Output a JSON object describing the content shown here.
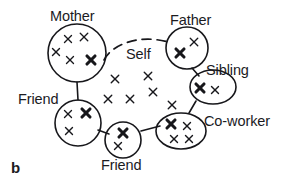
{
  "figure": {
    "panel_label": "b",
    "colors": {
      "ink": "#17171b",
      "background": "#ffffff",
      "text": "#1b1b1f"
    }
  },
  "labels": [
    {
      "id": "mother",
      "text": "Mother",
      "x": 50,
      "y": 9,
      "name": "label-mother"
    },
    {
      "id": "father",
      "text": "Father",
      "x": 170,
      "y": 13,
      "name": "label-father"
    },
    {
      "id": "self",
      "text": "Self",
      "x": 126,
      "y": 47,
      "name": "label-self"
    },
    {
      "id": "sibling",
      "text": "Sibling",
      "x": 206,
      "y": 63,
      "name": "label-sibling"
    },
    {
      "id": "friend_left",
      "text": "Friend",
      "x": 18,
      "y": 92,
      "name": "label-friend-left"
    },
    {
      "id": "coworker",
      "text": "Co-worker",
      "x": 204,
      "y": 114,
      "name": "label-coworker"
    },
    {
      "id": "friend_bottom",
      "text": "Friend",
      "x": 101,
      "y": 158,
      "name": "label-friend-bottom"
    }
  ],
  "clusters": [
    {
      "id": "mother",
      "label": "Mother",
      "shape": "circle",
      "cx": 77,
      "cy": 53,
      "rx": 29,
      "ry": 29,
      "members": [
        {
          "cx": 68,
          "cy": 39,
          "size": 7,
          "weight": "thin"
        },
        {
          "cx": 84,
          "cy": 37,
          "size": 7.5,
          "weight": "thin"
        },
        {
          "cx": 56,
          "cy": 52,
          "size": 7,
          "weight": "thin"
        },
        {
          "cx": 70,
          "cy": 60,
          "size": 7,
          "weight": "thin"
        },
        {
          "cx": 91,
          "cy": 60,
          "size": 8,
          "weight": "bold"
        }
      ]
    },
    {
      "id": "father",
      "label": "Father",
      "shape": "circle",
      "cx": 187,
      "cy": 48,
      "rx": 21,
      "ry": 21,
      "members": [
        {
          "cx": 180,
          "cy": 53,
          "size": 8,
          "weight": "bold"
        },
        {
          "cx": 194,
          "cy": 42,
          "size": 7.5,
          "weight": "thin"
        }
      ]
    },
    {
      "id": "sibling",
      "label": "Sibling",
      "shape": "ellipse",
      "cx": 213,
      "cy": 87,
      "rx": 23,
      "ry": 17,
      "members": [
        {
          "cx": 200,
          "cy": 88,
          "size": 8,
          "weight": "bold"
        },
        {
          "cx": 215,
          "cy": 90,
          "size": 7,
          "weight": "thin"
        }
      ]
    },
    {
      "id": "coworker",
      "label": "Co-worker",
      "shape": "ellipse",
      "cx": 181,
      "cy": 131,
      "rx": 25,
      "ry": 18,
      "members": [
        {
          "cx": 171,
          "cy": 124,
          "size": 8,
          "weight": "bold"
        },
        {
          "cx": 187,
          "cy": 126,
          "size": 7,
          "weight": "thin"
        },
        {
          "cx": 174,
          "cy": 139,
          "size": 7,
          "weight": "thin"
        },
        {
          "cx": 189,
          "cy": 139,
          "size": 7,
          "weight": "thin"
        }
      ]
    },
    {
      "id": "friend_left",
      "label": "Friend",
      "shape": "circle",
      "cx": 78,
      "cy": 123,
      "rx": 23,
      "ry": 23,
      "members": [
        {
          "cx": 68,
          "cy": 114,
          "size": 7,
          "weight": "thin"
        },
        {
          "cx": 86,
          "cy": 113,
          "size": 8,
          "weight": "bold"
        },
        {
          "cx": 69,
          "cy": 131,
          "size": 7,
          "weight": "thin"
        }
      ]
    },
    {
      "id": "friend_bottom",
      "label": "Friend",
      "shape": "circle",
      "cx": 123,
      "cy": 140,
      "rx": 18,
      "ry": 18,
      "members": [
        {
          "cx": 123,
          "cy": 133,
          "size": 8,
          "weight": "bold"
        },
        {
          "cx": 118,
          "cy": 146,
          "size": 7,
          "weight": "thin"
        }
      ]
    }
  ],
  "self_region_members": [
    {
      "cx": 115,
      "cy": 79,
      "size": 7.5,
      "weight": "thin"
    },
    {
      "cx": 148,
      "cy": 76,
      "size": 7.5,
      "weight": "thin"
    },
    {
      "cx": 108,
      "cy": 99,
      "size": 7.5,
      "weight": "thin"
    },
    {
      "cx": 130,
      "cy": 99,
      "size": 7.5,
      "weight": "thin"
    },
    {
      "cx": 153,
      "cy": 92,
      "size": 7.5,
      "weight": "thin"
    },
    {
      "cx": 172,
      "cy": 105,
      "size": 7.5,
      "weight": "thin"
    }
  ],
  "ties": [
    {
      "id": "mother-father",
      "style": "dashed",
      "path": "M 104 60 C 112 44, 140 34, 168 42",
      "name": "tie-mother-father"
    },
    {
      "id": "mother-friend-left",
      "style": "solid",
      "path": "M 77 82 L 78 100",
      "name": "tie-mother-friend-left"
    },
    {
      "id": "father-sibling",
      "style": "solid",
      "path": "M 192 68 L 199 76",
      "name": "tie-father-sibling"
    },
    {
      "id": "sibling-coworker",
      "style": "solid",
      "path": "M 196 101 L 189 113",
      "name": "tie-sibling-coworker"
    },
    {
      "id": "friend-left-friend-bottom",
      "style": "solid",
      "path": "M 98 130 L 109 134",
      "name": "tie-friend-left-friend-bottom"
    },
    {
      "id": "friend-bottom-coworker",
      "style": "solid",
      "path": "M 141 131 L 160 126",
      "name": "tie-friend-bottom-coworker"
    }
  ]
}
